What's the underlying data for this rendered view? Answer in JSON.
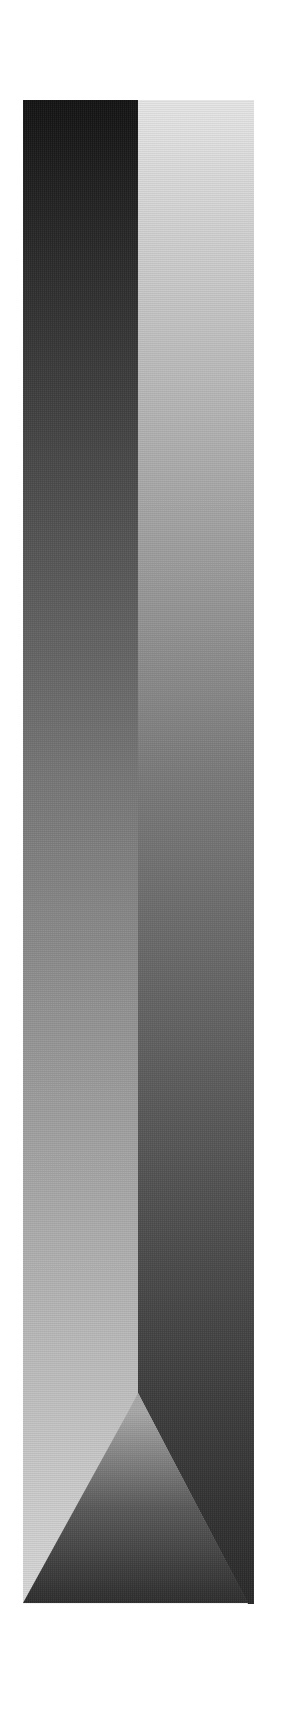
{
  "figure": {
    "bounds": {
      "x": 23,
      "y": 100,
      "width": 231,
      "height": 1504
    },
    "divider_x": 138,
    "divider_bend_y": 1393,
    "left_column": {
      "top_color": "#141414",
      "bottom_color": "#d8d8d8"
    },
    "right_column": {
      "top_color": "#e6e6e6",
      "bottom_color": "#2a2a2a"
    },
    "center_triangle": {
      "apex": [
        128,
        1412
      ],
      "base_left": [
        23,
        1603
      ],
      "base_right": [
        248,
        1603
      ],
      "top_color": "#a8a8a8",
      "bottom_color": "#2e2e2e"
    }
  }
}
